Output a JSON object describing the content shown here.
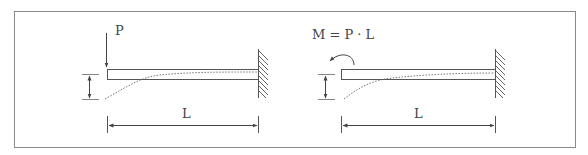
{
  "figure": {
    "colors": {
      "line": "#555555",
      "frame": "#8a8a8a",
      "background": "#ffffff"
    }
  },
  "left_diagram": {
    "load_label": "P",
    "load_type": "point-force",
    "span_label": "L"
  },
  "right_diagram": {
    "load_label": "M = P · L",
    "load_type": "moment",
    "span_label": "L"
  }
}
